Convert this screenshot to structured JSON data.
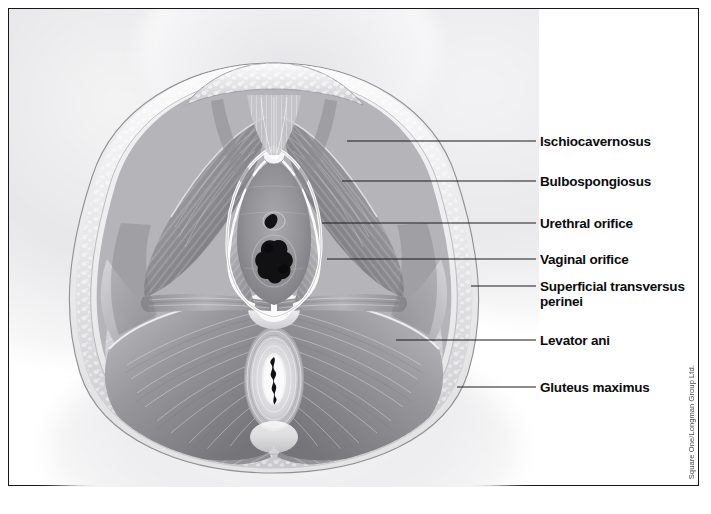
{
  "figure": {
    "type": "anatomical-illustration",
    "style": "grayscale airbrush medical illustration",
    "credit": "Square One/Longman Group Ltd."
  },
  "colors": {
    "frame": "#17171a",
    "leader_line": "#1a1a1d",
    "label_text": "#0b0b0d",
    "page_background": "#ffffff",
    "muscle_mid": "#9a9a9e",
    "muscle_dark": "#6e6e73",
    "muscle_light": "#d8d8db",
    "orifice_dark": "#141416",
    "fat_tissue": "#e9e9ec"
  },
  "labels": [
    {
      "id": "ischiocavernosus",
      "text": "Ischiocavernosus",
      "text_x": 531,
      "text_y": 125,
      "line_x1": 338,
      "line_y1": 132,
      "line_x2": 527,
      "line_y2": 132
    },
    {
      "id": "bulbospongiosus",
      "text": "Bulbospongiosus",
      "text_x": 531,
      "text_y": 165,
      "line_x1": 333,
      "line_y1": 172,
      "line_x2": 527,
      "line_y2": 172
    },
    {
      "id": "urethral-orifice",
      "text": "Urethral orifice",
      "text_x": 531,
      "text_y": 207,
      "line_x1": 313,
      "line_y1": 214,
      "line_x2": 527,
      "line_y2": 214
    },
    {
      "id": "vaginal-orifice",
      "text": "Vaginal orifice",
      "text_x": 531,
      "text_y": 243,
      "line_x1": 318,
      "line_y1": 250,
      "line_x2": 527,
      "line_y2": 250
    },
    {
      "id": "superficial-transversus-perinei",
      "text": "Superficial transversus\nperinei",
      "text_x": 531,
      "text_y": 270,
      "line_x1": 462,
      "line_y1": 277,
      "line_x2": 527,
      "line_y2": 277
    },
    {
      "id": "levator-ani",
      "text": "Levator ani",
      "text_x": 531,
      "text_y": 324,
      "line_x1": 387,
      "line_y1": 331,
      "line_x2": 527,
      "line_y2": 331
    },
    {
      "id": "gluteus-maximus",
      "text": "Gluteus maximus",
      "text_x": 531,
      "text_y": 371,
      "line_x1": 448,
      "line_y1": 378,
      "line_x2": 527,
      "line_y2": 378
    }
  ]
}
